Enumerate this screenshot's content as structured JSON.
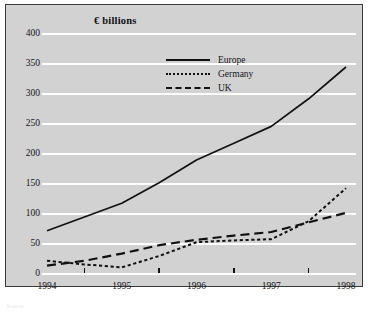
{
  "chart_data": {
    "type": "line",
    "title": "€ billions",
    "xlabel": "",
    "ylabel": "",
    "ylim": [
      0,
      400
    ],
    "xlim": [
      1994,
      1998
    ],
    "yticks": [
      0,
      50,
      100,
      150,
      200,
      250,
      300,
      350,
      400
    ],
    "ytick_labels": [
      "0",
      "50",
      "100",
      "150",
      "200",
      "250",
      "300",
      "350",
      "400"
    ],
    "xticks": [
      1994,
      1995,
      1996,
      1997,
      1998
    ],
    "xtick_labels": [
      "1994",
      "1995",
      "1996",
      "1997",
      "1998"
    ],
    "minor_xticks": [
      1994.5,
      1995.5,
      1996.5,
      1997.5
    ],
    "grid": "horizontal-white",
    "legend_position": "upper-center",
    "x": [
      1994,
      1994.5,
      1995,
      1995.5,
      1996,
      1996.5,
      1997,
      1997.5,
      1998
    ],
    "series": [
      {
        "name": "Europe",
        "style": "solid",
        "color": "#111111",
        "values": [
          72,
          95,
          118,
          152,
          190,
          218,
          246,
          292,
          345
        ]
      },
      {
        "name": "Germany",
        "style": "dotted",
        "color": "#111111",
        "values": [
          22,
          16,
          11,
          30,
          53,
          56,
          58,
          88,
          143
        ]
      },
      {
        "name": "UK",
        "style": "dashed",
        "color": "#111111",
        "values": [
          14,
          22,
          34,
          48,
          57,
          64,
          70,
          86,
          102
        ]
      }
    ]
  },
  "legend": {
    "items": [
      {
        "label": "Europe",
        "style": "solid"
      },
      {
        "label": "Germany",
        "style": "dotted"
      },
      {
        "label": "UK",
        "style": "dashed"
      }
    ]
  },
  "caption": {
    "text": "Source:"
  },
  "colors": {
    "panel_background": "#d2d2d2",
    "page_background": "#ffffff",
    "gridline": "#ffffff",
    "border": "#3a3a3a",
    "ink": "#111111"
  }
}
